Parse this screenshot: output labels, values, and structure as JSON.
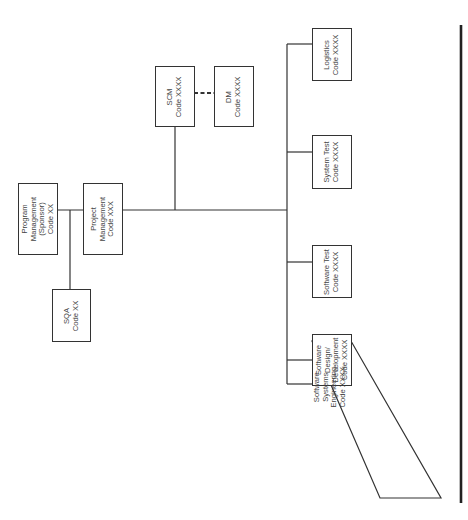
{
  "diagram": {
    "type": "organization-chart",
    "orientation": "rotated-90-ccw",
    "colors": {
      "line": "#333333",
      "text": "#444444",
      "background": "#ffffff"
    },
    "nodes": [
      {
        "id": "program",
        "lines": [
          "Program",
          "Management",
          "(Sponsor)",
          "Code XX"
        ]
      },
      {
        "id": "project",
        "lines": [
          "Project",
          "Management",
          "Code XXX"
        ]
      },
      {
        "id": "sqa",
        "lines": [
          "SQA",
          "Code XX"
        ]
      },
      {
        "id": "scm",
        "lines": [
          "SCM",
          "Code XXXX"
        ]
      },
      {
        "id": "dm",
        "lines": [
          "DM",
          "Code XXXX"
        ]
      },
      {
        "id": "logistics",
        "lines": [
          "Logistics",
          "Code XXXX"
        ]
      },
      {
        "id": "system_test",
        "lines": [
          "System Test",
          "Code XXXX"
        ]
      },
      {
        "id": "software_test",
        "lines": [
          "Software Test",
          "Code XXXX"
        ]
      },
      {
        "id": "sw_design",
        "lines": [
          "Software",
          "Design/",
          "Development",
          "Code XXXX"
        ]
      },
      {
        "id": "sw_sys_eng",
        "lines": [
          "Software",
          "Systems",
          "Engineering",
          "Code XXXX"
        ],
        "shape": "parallelogram"
      }
    ],
    "edges": [
      {
        "from": "program",
        "to": "project",
        "style": "solid"
      },
      {
        "from": "program",
        "to": "sqa",
        "style": "solid"
      },
      {
        "from": "project",
        "to": "scm",
        "style": "solid"
      },
      {
        "from": "scm",
        "to": "dm",
        "style": "dashed"
      },
      {
        "from": "project",
        "to": "logistics",
        "style": "solid"
      },
      {
        "from": "project",
        "to": "system_test",
        "style": "solid"
      },
      {
        "from": "project",
        "to": "software_test",
        "style": "solid"
      },
      {
        "from": "project",
        "to": "sw_design",
        "style": "solid"
      },
      {
        "from": "project",
        "to": "sw_sys_eng",
        "style": "solid"
      }
    ]
  }
}
